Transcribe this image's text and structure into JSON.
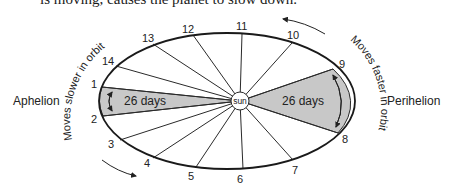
{
  "caption": "is moving, causes the planet to slow down.",
  "labels": {
    "aphelion": "Aphelion",
    "perihelion": "Perihelion",
    "sun": "sun",
    "slower": "Moves slower in orbit",
    "faster": "Moves faster in orbit",
    "sector_left": "26 days",
    "sector_right": "26 days"
  },
  "positions": [
    "1",
    "2",
    "3",
    "4",
    "5",
    "6",
    "7",
    "8",
    "9",
    "10",
    "11",
    "12",
    "13",
    "14"
  ],
  "colors": {
    "sector_fill": "#c8c8c8",
    "line": "#2a2a2a",
    "background": "#ffffff"
  }
}
